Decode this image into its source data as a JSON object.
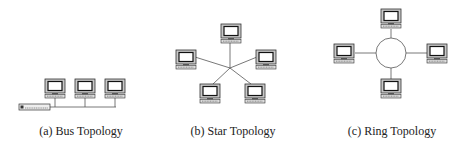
{
  "figure": {
    "panels": [
      {
        "id": "bus",
        "caption": "(a) Bus Topology",
        "node_count": 3,
        "has_terminator": true,
        "icon": "computer-icon"
      },
      {
        "id": "star",
        "caption": "(b) Star Topology",
        "node_count": 5,
        "icon": "computer-icon"
      },
      {
        "id": "ring",
        "caption": "(c) Ring Topology",
        "node_count": 4,
        "icon": "computer-icon"
      }
    ],
    "colors": {
      "line": "#555555",
      "monitor_frame": "#444444",
      "screen": "#ffffff",
      "bezel": "#bbbbbb"
    }
  }
}
